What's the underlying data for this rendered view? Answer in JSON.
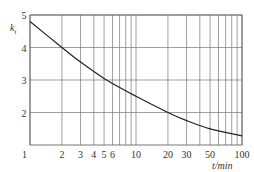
{
  "chart_data": {
    "type": "line",
    "title": "",
    "xlabel": "t/min",
    "ylabel": "k_t",
    "xscale": "log",
    "xlim": [
      1,
      100
    ],
    "ylim": [
      1,
      5
    ],
    "grid": true,
    "x_ticks": [
      1,
      2,
      3,
      4,
      5,
      6,
      10,
      20,
      30,
      50,
      100
    ],
    "x_tick_labels": [
      "1",
      "2",
      "3",
      "4",
      "5",
      "6",
      "10",
      "20",
      "30",
      "50",
      "100"
    ],
    "x_gridlines": [
      1,
      2,
      3,
      4,
      5,
      6,
      7,
      8,
      9,
      10,
      20,
      30,
      40,
      50,
      60,
      70,
      80,
      90,
      100
    ],
    "y_ticks": [
      2,
      3,
      4,
      5
    ],
    "y_tick_labels": [
      "2",
      "3",
      "4",
      "5"
    ],
    "series": [
      {
        "name": "k_t",
        "x": [
          1,
          2,
          3,
          5,
          10,
          20,
          30,
          50,
          100
        ],
        "y": [
          4.8,
          4.0,
          3.55,
          3.05,
          2.5,
          2.0,
          1.75,
          1.5,
          1.28
        ]
      }
    ]
  },
  "labels": {
    "ylabel_main": "k",
    "ylabel_sub": "t",
    "xlabel": "t/min",
    "origin": "1"
  }
}
